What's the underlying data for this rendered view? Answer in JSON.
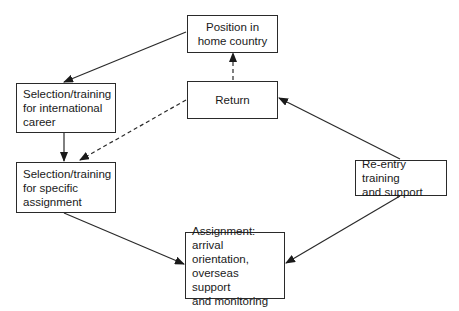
{
  "diagram": {
    "type": "flow-cycle",
    "nodes": [
      {
        "id": "position",
        "lines": [
          "Position in",
          "home country"
        ]
      },
      {
        "id": "return",
        "lines": [
          "Return"
        ]
      },
      {
        "id": "intl",
        "lines": [
          "Selection/training",
          "for international",
          "career"
        ]
      },
      {
        "id": "specific",
        "lines": [
          "Selection/training",
          "for specific",
          "assignment"
        ]
      },
      {
        "id": "reentry",
        "lines": [
          "Re-entry training",
          "and support"
        ]
      },
      {
        "id": "assignment",
        "lines": [
          "Assignment:",
          "arrival orientation,",
          "overseas support",
          "and monitoring"
        ]
      }
    ],
    "edges": [
      {
        "from": "position",
        "to": "intl",
        "style": "solid"
      },
      {
        "from": "intl",
        "to": "specific",
        "style": "solid"
      },
      {
        "from": "specific",
        "to": "assignment",
        "style": "solid"
      },
      {
        "from": "reentry",
        "to": "assignment",
        "style": "solid"
      },
      {
        "from": "reentry",
        "to": "return",
        "style": "solid"
      },
      {
        "from": "return",
        "to": "position",
        "style": "dashed"
      },
      {
        "from": "return",
        "to": "specific",
        "style": "dashed"
      }
    ],
    "line_color": "#2a2a2a"
  }
}
